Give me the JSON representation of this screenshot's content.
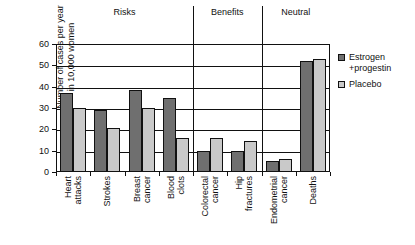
{
  "chart_data": {
    "type": "bar",
    "title": "",
    "xlabel": "",
    "ylabel": "Number of cases per year\nin 10,000 women",
    "ylim": [
      0,
      60
    ],
    "ytick_values": [
      0,
      10,
      20,
      30,
      40,
      50,
      60
    ],
    "ytick_labels": [
      "0",
      "10",
      "20",
      "30",
      "40",
      "50",
      "60"
    ],
    "grid": true,
    "legend_position": "right",
    "categories": [
      "Heart\nattacks",
      "Strokes",
      "Breast\ncancer",
      "Blood\nclots",
      "Colorectal\ncancer",
      "Hip\nfractures",
      "Endometrial\ncancer",
      "Deaths"
    ],
    "series": [
      {
        "name": "Estrogen\n+progestin",
        "color": "#6f6f6f",
        "values": [
          37,
          29,
          38.5,
          34.5,
          10,
          10,
          5.3,
          52
        ]
      },
      {
        "name": "Placebo",
        "color": "#c9c9c9",
        "values": [
          30,
          20.5,
          30,
          16,
          16,
          14.7,
          6.2,
          53
        ]
      }
    ],
    "groups": [
      {
        "label": "Risks",
        "start_index": 0,
        "end_index": 3
      },
      {
        "label": "Benefits",
        "start_index": 4,
        "end_index": 5
      },
      {
        "label": "Neutral",
        "start_index": 6,
        "end_index": 7
      }
    ],
    "annotations": []
  }
}
